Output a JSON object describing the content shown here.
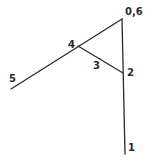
{
  "diagram": {
    "type": "line-figure",
    "stroke_color": "#2a2a2a",
    "background_color": "#ffffff",
    "labels": {
      "top": "0,6",
      "node2": "2",
      "node3": "3",
      "node4": "4",
      "node5": "5",
      "node1": "1"
    },
    "nodes": [
      {
        "id": "0,6",
        "x": 122,
        "y": 19
      },
      {
        "id": "4",
        "x": 78,
        "y": 46
      },
      {
        "id": "3",
        "x": 100,
        "y": 59
      },
      {
        "id": "2",
        "x": 123,
        "y": 73
      },
      {
        "id": "5",
        "x": 11,
        "y": 89
      },
      {
        "id": "1",
        "x": 125,
        "y": 154
      }
    ],
    "edges": [
      {
        "from": "5",
        "to": "0,6"
      },
      {
        "from": "0,6",
        "to": "1"
      },
      {
        "from": "4",
        "to": "2"
      }
    ]
  }
}
